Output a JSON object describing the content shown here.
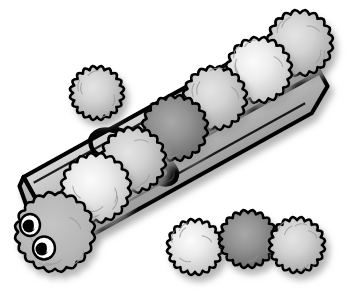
{
  "canvas": {
    "width": 359,
    "height": 296,
    "background": "#ffffff",
    "title": "clothespin-with-pompoms-illustration",
    "description": "Grayscale clip-art of a wooden clothespin lying diagonally with fuzzy pom-pom balls resting along it; the leftmost ball has two cartoon eyes forming a caterpillar head. Three loose pom-poms sit at lower right and one at upper left."
  },
  "palette": {
    "outline": "#000000",
    "white": "#ffffff",
    "wood_light": "#c9c9c9",
    "wood_mid": "#b4b4b4",
    "wood_dark": "#9a9a9a",
    "wood_shadow": "#8c8c8c",
    "ball_light_center": "#f2f2f2",
    "ball_light_edge": "#c2c2c2",
    "ball_mid_center": "#dcdcdc",
    "ball_mid_edge": "#a8a8a8",
    "ball_dark_center": "#9e9e9e",
    "ball_dark_edge": "#6a6a6a",
    "head_fill": "#b8b8b8",
    "head_edge": "#a0a0a0",
    "eye_white": "#ffffff",
    "eye_pupil": "#000000",
    "drop_shadow": "#b0b0b0",
    "texture_line": "#9b9b9b"
  },
  "objects": {
    "clothespin": {
      "name": "wooden-clothespin",
      "angle_degrees": -29,
      "parts": [
        {
          "name": "upper-jaw-plank",
          "fill": "#c9c9c9"
        },
        {
          "name": "lower-jaw-plank",
          "fill": "#b4b4b4"
        },
        {
          "name": "side-edge-strip",
          "fill": "#9a9a9a"
        },
        {
          "name": "groove-slot",
          "fill": "#8c8c8c"
        },
        {
          "name": "wire-spring-coil",
          "fill": "#000000"
        }
      ]
    },
    "pompoms_on_pin": [
      {
        "id": "pom-head",
        "label": "head-pompom-with-eyes",
        "cx": 55,
        "cy": 232,
        "r": 40,
        "tone": "head",
        "has_eyes": true
      },
      {
        "id": "pom-1",
        "label": "pompom-1",
        "cx": 96,
        "cy": 188,
        "r": 35,
        "tone": "light"
      },
      {
        "id": "pom-2",
        "label": "pompom-2",
        "cx": 133,
        "cy": 160,
        "r": 33,
        "tone": "mid"
      },
      {
        "id": "pom-3",
        "label": "pompom-3",
        "cx": 175,
        "cy": 128,
        "r": 33,
        "tone": "dark"
      },
      {
        "id": "pom-4",
        "label": "pompom-4",
        "cx": 215,
        "cy": 98,
        "r": 32,
        "tone": "mid"
      },
      {
        "id": "pom-5",
        "label": "pompom-5",
        "cx": 259,
        "cy": 70,
        "r": 33,
        "tone": "light"
      },
      {
        "id": "pom-6",
        "label": "pompom-6",
        "cx": 300,
        "cy": 43,
        "r": 33,
        "tone": "mid"
      }
    ],
    "pompoms_loose": [
      {
        "id": "pom-free-top",
        "label": "loose-pompom-upper-left",
        "cx": 97,
        "cy": 93,
        "r": 27,
        "tone": "mid"
      },
      {
        "id": "pom-free-a",
        "label": "loose-pompom-left",
        "cx": 195,
        "cy": 247,
        "r": 28,
        "tone": "light"
      },
      {
        "id": "pom-free-b",
        "label": "loose-pompom-center-dark",
        "cx": 248,
        "cy": 239,
        "r": 29,
        "tone": "dark"
      },
      {
        "id": "pom-free-c",
        "label": "loose-pompom-right",
        "cx": 297,
        "cy": 245,
        "r": 28,
        "tone": "mid"
      }
    ],
    "eyes": [
      {
        "name": "left-eye",
        "cx": 30,
        "cy": 225,
        "rx": 10,
        "ry": 11,
        "pupil_cx": 29,
        "pupil_cy": 226,
        "pupil_r": 6.5
      },
      {
        "name": "right-eye",
        "cx": 44,
        "cy": 248,
        "rx": 11,
        "ry": 11.5,
        "pupil_cx": 42,
        "pupil_cy": 249,
        "pupil_r": 6.5
      }
    ]
  },
  "counts": {
    "pompoms_total": 11,
    "pompoms_on_clothespin": 7,
    "pompoms_loose": 4,
    "eyes": 2
  }
}
